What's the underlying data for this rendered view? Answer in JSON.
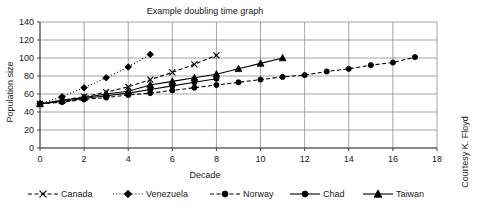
{
  "chart_data": {
    "type": "line",
    "title": "Example doubling time graph",
    "xlabel": "Decade",
    "ylabel": "Population size",
    "xlim": [
      0,
      18
    ],
    "ylim": [
      0,
      140
    ],
    "xticks": [
      0,
      2,
      4,
      6,
      8,
      10,
      12,
      14,
      16,
      18
    ],
    "yticks": [
      0,
      20,
      40,
      60,
      80,
      100,
      120,
      140
    ],
    "grid": "horizontal-and-vertical",
    "legend_position": "bottom",
    "credit": "Courtesy K. Floyd",
    "series": [
      {
        "name": "Canada",
        "marker": "x",
        "linestyle": "dashed",
        "x": [
          0,
          1,
          2,
          3,
          4,
          5,
          6,
          7,
          8
        ],
        "values": [
          49,
          53,
          57,
          62,
          68,
          76,
          84,
          93,
          103
        ]
      },
      {
        "name": "Venezuela",
        "marker": "diamond",
        "linestyle": "dotted",
        "x": [
          0,
          1,
          2,
          3,
          4,
          5
        ],
        "values": [
          49,
          57,
          67,
          78,
          90,
          104
        ]
      },
      {
        "name": "Norway",
        "marker": "circle",
        "linestyle": "dashed",
        "x": [
          0,
          1,
          2,
          3,
          4,
          5,
          6,
          7,
          8,
          9,
          10,
          11,
          12,
          13,
          14,
          15,
          16,
          17
        ],
        "values": [
          49,
          51,
          54,
          56,
          59,
          61,
          64,
          67,
          70,
          73,
          76,
          79,
          81,
          85,
          88,
          92,
          95,
          101
        ]
      },
      {
        "name": "Chad",
        "marker": "circle",
        "linestyle": "solid",
        "x": [
          0,
          1,
          2,
          3,
          4,
          5,
          6,
          7,
          8
        ],
        "values": [
          49,
          52,
          55,
          58,
          61,
          65,
          69,
          73,
          77
        ]
      },
      {
        "name": "Taiwan",
        "marker": "triangle",
        "linestyle": "solid",
        "x": [
          0,
          1,
          2,
          3,
          4,
          5,
          6,
          7,
          8,
          9,
          10,
          11
        ],
        "values": [
          49,
          53,
          56,
          60,
          63,
          70,
          74,
          78,
          82,
          88,
          94,
          100
        ]
      }
    ]
  },
  "legend": {
    "items": [
      {
        "label": "Canada"
      },
      {
        "label": "Venezuela"
      },
      {
        "label": "Norway"
      },
      {
        "label": "Chad"
      },
      {
        "label": "Taiwan"
      }
    ]
  },
  "axis_text": {
    "y_ticks": [
      "140",
      "120",
      "100",
      "80",
      "60",
      "40",
      "20",
      "0"
    ],
    "x_ticks": [
      "0",
      "2",
      "4",
      "6",
      "8",
      "10",
      "12",
      "14",
      "16",
      "18"
    ]
  }
}
